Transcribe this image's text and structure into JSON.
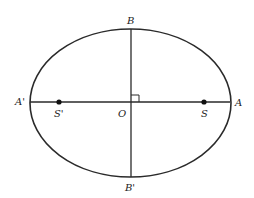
{
  "diagram": {
    "type": "ellipse-with-axes",
    "colors": {
      "stroke": "#2a2a2a",
      "background": "#ffffff",
      "text": "#222222"
    },
    "labels": {
      "top": "B",
      "bottom": "B'",
      "left": "A'",
      "right": "A",
      "center": "O",
      "focus_left": "S'",
      "focus_right": "S"
    },
    "right_angle_marker": true
  }
}
